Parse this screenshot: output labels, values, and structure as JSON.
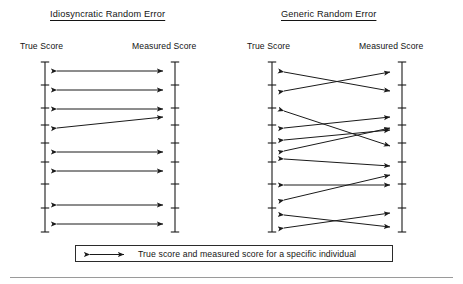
{
  "figure": {
    "title_left": "Idiosyncratic Random Error",
    "title_right": "Generic Random Error",
    "true_score_label": "True Score",
    "measured_score_label": "Measured Score",
    "legend_text": "True score and measured score for a specific individual",
    "legend_arrow_icon": "double-headed-arrow-icon",
    "line_color": "#1a1a1a",
    "background_color": "#ffffff"
  },
  "chart_data": {
    "type": "diagram",
    "panels": [
      {
        "name": "Idiosyncratic Random Error",
        "title": "Idiosyncratic Random Error",
        "left_axis": {
          "label": "True Score",
          "x": 45,
          "y_top": 62,
          "y_bottom": 232,
          "ticks": [
            62,
            85,
            108,
            125,
            143,
            162,
            184,
            208,
            232
          ]
        },
        "right_axis": {
          "label": "Measured Score",
          "x": 175,
          "y_top": 62,
          "y_bottom": 232,
          "ticks": [
            62,
            85,
            108,
            125,
            143,
            162,
            184,
            208,
            232
          ]
        },
        "arrows": [
          {
            "from_y": 71,
            "to_y": 71
          },
          {
            "from_y": 90,
            "to_y": 90
          },
          {
            "from_y": 109,
            "to_y": 109
          },
          {
            "from_y": 128,
            "to_y": 117
          },
          {
            "from_y": 152,
            "to_y": 152
          },
          {
            "from_y": 171,
            "to_y": 171
          },
          {
            "from_y": 205,
            "to_y": 205
          },
          {
            "from_y": 224,
            "to_y": 224
          }
        ],
        "arrow_count": 8,
        "note": "Most arrows are horizontal: measured score roughly equals true score; one arrow is tilted showing individual-specific error."
      },
      {
        "name": "Generic Random Error",
        "title": "Generic Random Error",
        "left_axis": {
          "label": "True Score",
          "x": 272,
          "y_top": 62,
          "y_bottom": 232,
          "ticks": [
            62,
            85,
            108,
            125,
            143,
            162,
            184,
            208,
            232
          ]
        },
        "right_axis": {
          "label": "Measured Score",
          "x": 402,
          "y_top": 62,
          "y_bottom": 232,
          "ticks": [
            62,
            85,
            108,
            125,
            143,
            162,
            184,
            208,
            232
          ]
        },
        "arrows": [
          {
            "from_y": 72,
            "to_y": 91
          },
          {
            "from_y": 91,
            "to_y": 72
          },
          {
            "from_y": 111,
            "to_y": 146
          },
          {
            "from_y": 128,
            "to_y": 117
          },
          {
            "from_y": 140,
            "to_y": 130
          },
          {
            "from_y": 151,
            "to_y": 128
          },
          {
            "from_y": 159,
            "to_y": 166
          },
          {
            "from_y": 185,
            "to_y": 185
          },
          {
            "from_y": 200,
            "to_y": 175
          },
          {
            "from_y": 215,
            "to_y": 227
          },
          {
            "from_y": 228,
            "to_y": 213
          }
        ],
        "arrow_count": 11,
        "note": "Arrows cross each other extensively: measured scores are displaced in a non-individual-specific, generic random way."
      }
    ],
    "legend": {
      "entries": [
        {
          "symbol": "double-headed-arrow",
          "label": "True score and measured score for a specific individual"
        }
      ],
      "position": "bottom-center"
    },
    "xlabel": "",
    "ylabel": "",
    "grid": false
  }
}
